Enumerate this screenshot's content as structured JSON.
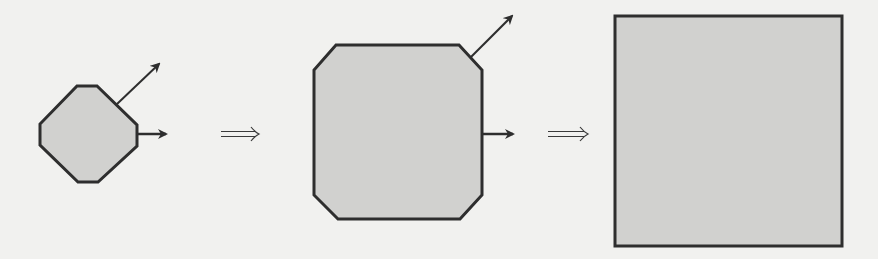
{
  "diagram": {
    "type": "shape-transformation-sequence",
    "colors": {
      "background": "#f1f1ef",
      "shape_fill": "#d1d1cf",
      "stroke": "#2e2e2e"
    },
    "stages": [
      {
        "id": "small-octagon",
        "shape": "octagon",
        "points": "77,86 97,86 137,125 137,146 98,182 78,182 40,145 40,124",
        "arrows": [
          {
            "id": "diagonal-arrow",
            "x1": 117,
            "y1": 104,
            "x2": 159,
            "y2": 64
          },
          {
            "id": "right-arrow",
            "x1": 137,
            "y1": 134,
            "x2": 166,
            "y2": 134
          }
        ]
      },
      {
        "id": "large-octagon",
        "shape": "octagon",
        "points": "336,45 459,45 482,70 482,195 460,219 338,219 314,195 314,70",
        "arrows": [
          {
            "id": "diagonal-arrow",
            "x1": 470,
            "y1": 58,
            "x2": 512,
            "y2": 16
          },
          {
            "id": "right-arrow",
            "x1": 482,
            "y1": 134,
            "x2": 513,
            "y2": 134
          }
        ]
      },
      {
        "id": "square",
        "shape": "rectangle",
        "x": 615,
        "y": 16,
        "width": 227,
        "height": 230,
        "arrows": []
      }
    ],
    "implies_arrows": [
      {
        "id": "implies-1",
        "symbol": "⟹",
        "x1": 221,
        "x2": 259,
        "y": 134
      },
      {
        "id": "implies-2",
        "symbol": "⟹",
        "x1": 548,
        "x2": 588,
        "y": 134
      }
    ]
  }
}
